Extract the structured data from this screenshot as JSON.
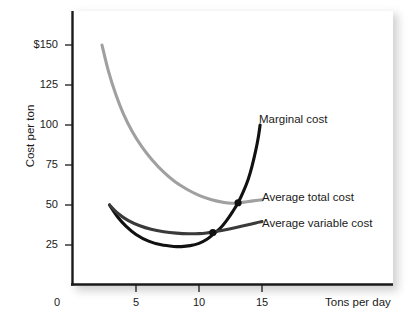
{
  "chart_data": {
    "type": "line",
    "title": "",
    "xlabel": "Tons per day",
    "ylabel": "Cost per ton",
    "xlim": [
      0,
      20
    ],
    "ylim": [
      0,
      162
    ],
    "grid": false,
    "legend_position": "inline-right-of-curves",
    "x_ticks": [
      {
        "value": 0,
        "label": "0"
      },
      {
        "value": 5,
        "label": "5"
      },
      {
        "value": 10,
        "label": "10"
      },
      {
        "value": 15,
        "label": "15"
      }
    ],
    "y_ticks": [
      {
        "value": 150,
        "label": "$150"
      },
      {
        "value": 125,
        "label": "125"
      },
      {
        "value": 100,
        "label": "100"
      },
      {
        "value": 75,
        "label": "75"
      },
      {
        "value": 50,
        "label": "50"
      },
      {
        "value": 25,
        "label": "25"
      }
    ],
    "series": [
      {
        "name": "Marginal cost",
        "color": "#111111",
        "width": 3.1,
        "label_x": 259,
        "label_y": 113,
        "points": [
          [
            2.9,
            50.0
          ],
          [
            3.5,
            43.0
          ],
          [
            4.2,
            36.8
          ],
          [
            5.0,
            31.6
          ],
          [
            6.0,
            27.4
          ],
          [
            7.0,
            25.1
          ],
          [
            8.0,
            24.1
          ],
          [
            8.6,
            24.0
          ],
          [
            9.3,
            24.6
          ],
          [
            10.0,
            26.0
          ],
          [
            10.6,
            28.4
          ],
          [
            11.1,
            31.5
          ],
          [
            11.7,
            35.6
          ],
          [
            12.2,
            40.4
          ],
          [
            12.7,
            46.2
          ],
          [
            13.1,
            51.4
          ],
          [
            13.5,
            58.0
          ],
          [
            13.9,
            66.0
          ],
          [
            14.2,
            74.0
          ],
          [
            14.5,
            84.0
          ],
          [
            14.7,
            92.0
          ],
          [
            14.85,
            100.0
          ]
        ]
      },
      {
        "name": "Average total cost",
        "color": "#a0a0a0",
        "width": 3.1,
        "label_x": 262,
        "label_y": 191,
        "points": [
          [
            2.3,
            150.0
          ],
          [
            2.8,
            134.0
          ],
          [
            3.4,
            119.0
          ],
          [
            4.0,
            107.0
          ],
          [
            4.7,
            96.0
          ],
          [
            5.5,
            86.0
          ],
          [
            6.3,
            78.0
          ],
          [
            7.2,
            70.5
          ],
          [
            8.1,
            64.5
          ],
          [
            9.0,
            60.0
          ],
          [
            10.0,
            56.0
          ],
          [
            11.0,
            53.3
          ],
          [
            12.0,
            51.6
          ],
          [
            12.6,
            51.1
          ],
          [
            13.1,
            51.3
          ],
          [
            13.7,
            51.9
          ],
          [
            14.3,
            52.6
          ],
          [
            15.0,
            53.2
          ]
        ]
      },
      {
        "name": "Average variable cost",
        "color": "#3a3a3a",
        "width": 3.1,
        "label_x": 262,
        "label_y": 217,
        "points": [
          [
            2.9,
            50.0
          ],
          [
            3.6,
            44.5
          ],
          [
            4.4,
            40.2
          ],
          [
            5.3,
            37.0
          ],
          [
            6.2,
            34.8
          ],
          [
            7.2,
            33.3
          ],
          [
            8.2,
            32.4
          ],
          [
            9.2,
            32.0
          ],
          [
            10.0,
            32.1
          ],
          [
            10.6,
            32.5
          ],
          [
            11.1,
            33.1
          ],
          [
            11.8,
            34.1
          ],
          [
            12.5,
            35.2
          ],
          [
            13.2,
            36.4
          ],
          [
            13.9,
            37.7
          ],
          [
            14.5,
            38.8
          ],
          [
            15.0,
            39.6
          ]
        ]
      }
    ],
    "markers": [
      {
        "name": "mc-atc-intersection",
        "x": 13.1,
        "y": 51.4,
        "color": "#111111",
        "r": 3.6
      },
      {
        "name": "mc-avc-intersection",
        "x": 11.1,
        "y": 32.8,
        "color": "#111111",
        "r": 3.6
      }
    ]
  }
}
